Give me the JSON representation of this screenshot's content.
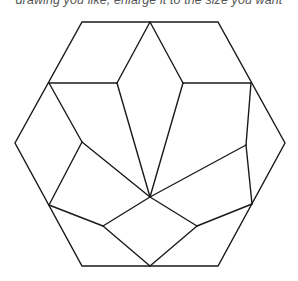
{
  "caption": {
    "text": "drawing you like, enlarge it to the size you want"
  },
  "diagram": {
    "stroke_color": "#1a1a1a",
    "background_color": "#ffffff",
    "hexagon": {
      "vertices": [
        [
          82,
          22
        ],
        [
          218,
          22
        ],
        [
          285,
          143
        ],
        [
          218,
          266
        ],
        [
          82,
          266
        ],
        [
          15,
          143
        ]
      ]
    },
    "lines": [
      {
        "from": [
          150,
          22
        ],
        "to": [
          117,
          83
        ]
      },
      {
        "from": [
          150,
          22
        ],
        "to": [
          183,
          83
        ]
      },
      {
        "from": [
          49,
          83
        ],
        "to": [
          117,
          83
        ]
      },
      {
        "from": [
          183,
          83
        ],
        "to": [
          251,
          83
        ]
      },
      {
        "from": [
          117,
          83
        ],
        "to": [
          150,
          197
        ]
      },
      {
        "from": [
          183,
          83
        ],
        "to": [
          150,
          197
        ]
      },
      {
        "from": [
          49,
          83
        ],
        "to": [
          82,
          142
        ]
      },
      {
        "from": [
          82,
          142
        ],
        "to": [
          150,
          197
        ]
      },
      {
        "from": [
          82,
          142
        ],
        "to": [
          49,
          205
        ]
      },
      {
        "from": [
          251,
          83
        ],
        "to": [
          246,
          145
        ]
      },
      {
        "from": [
          246,
          145
        ],
        "to": [
          150,
          197
        ]
      },
      {
        "from": [
          246,
          145
        ],
        "to": [
          252,
          204
        ]
      },
      {
        "from": [
          49,
          205
        ],
        "to": [
          103,
          226
        ]
      },
      {
        "from": [
          103,
          226
        ],
        "to": [
          150,
          197
        ]
      },
      {
        "from": [
          103,
          226
        ],
        "to": [
          150,
          266
        ]
      },
      {
        "from": [
          252,
          204
        ],
        "to": [
          197,
          226
        ]
      },
      {
        "from": [
          197,
          226
        ],
        "to": [
          150,
          197
        ]
      },
      {
        "from": [
          197,
          226
        ],
        "to": [
          150,
          266
        ]
      }
    ]
  }
}
